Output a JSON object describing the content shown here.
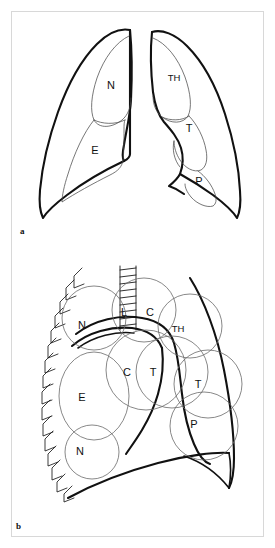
{
  "figure": {
    "background_color": "#ffffff",
    "frame_color": "#d8d8d8",
    "ink_color": "#111111",
    "panels": [
      {
        "id": "a",
        "caption": "a",
        "description": "Frontal chest outline with both lungs divided into labelled review zones",
        "labels": [
          {
            "text": "N",
            "side": "left-lung",
            "x": 105,
            "y": 82
          },
          {
            "text": "E",
            "side": "left-lung",
            "x": 88,
            "y": 147
          },
          {
            "text": "TH",
            "side": "right-lung",
            "x": 172,
            "y": 74
          },
          {
            "text": "T",
            "side": "right-lung",
            "x": 186,
            "y": 124
          },
          {
            "text": "P",
            "side": "right-lung",
            "x": 193,
            "y": 176
          }
        ]
      },
      {
        "id": "b",
        "caption": "b",
        "description": "Right hemithorax enlarged with overlapping circular search zones, rib markings and trachea",
        "labels": [
          {
            "text": "N",
            "x": 82,
            "y": 326
          },
          {
            "text": "L",
            "x": 124,
            "y": 313
          },
          {
            "text": "C",
            "x": 150,
            "y": 313
          },
          {
            "text": "TH",
            "x": 177,
            "y": 329
          },
          {
            "text": "C",
            "x": 127,
            "y": 373
          },
          {
            "text": "T",
            "x": 153,
            "y": 373
          },
          {
            "text": "T",
            "x": 197,
            "y": 385
          },
          {
            "text": "E",
            "x": 82,
            "y": 398
          },
          {
            "text": "P",
            "x": 193,
            "y": 425
          },
          {
            "text": "N",
            "x": 80,
            "y": 452
          }
        ]
      }
    ],
    "zone_legend": [
      {
        "code": "N",
        "meaning": "Nodule zone"
      },
      {
        "code": "E",
        "meaning": "Edge / peripheral zone"
      },
      {
        "code": "TH",
        "meaning": "Thoracic apex zone"
      },
      {
        "code": "T",
        "meaning": "Tracheal / hilar zone"
      },
      {
        "code": "P",
        "meaning": "Paracardiac zone"
      },
      {
        "code": "L",
        "meaning": "Left paratracheal zone"
      },
      {
        "code": "C",
        "meaning": "Central zone"
      }
    ]
  }
}
